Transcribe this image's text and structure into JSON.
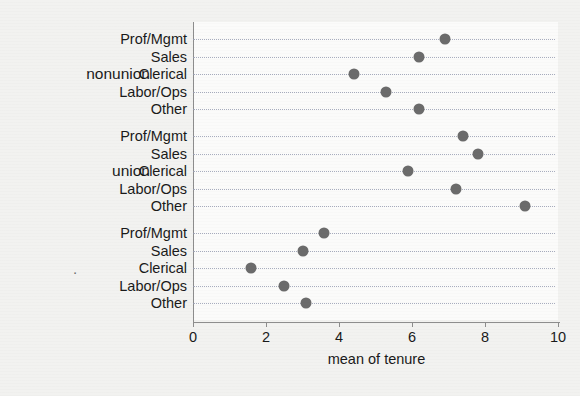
{
  "chart_data": {
    "type": "scatter",
    "subtype": "dot-plot",
    "title": "",
    "xlabel": "mean of tenure",
    "ylabel": "",
    "xlim": [
      0,
      10
    ],
    "xticks": [
      0,
      2,
      4,
      6,
      8,
      10
    ],
    "xtick_labels": [
      "0",
      "2",
      "4",
      "6",
      "8",
      "10"
    ],
    "grid": true,
    "grid_style": "horizontal dotted",
    "legend": "none",
    "marker_color": "#6b6b6b",
    "background_color": "#f2f2f0",
    "plot_background_color": "#fbfbfa",
    "axis_color": "#8d8d8d",
    "groups": [
      {
        "label": "nonunion",
        "categories": [
          "Prof/Mgmt",
          "Sales",
          "Clerical",
          "Labor/Ops",
          "Other"
        ],
        "values": [
          6.9,
          6.2,
          4.4,
          5.3,
          6.2
        ]
      },
      {
        "label": "union",
        "categories": [
          "Prof/Mgmt",
          "Sales",
          "Clerical",
          "Labor/Ops",
          "Other"
        ],
        "values": [
          7.4,
          7.8,
          5.9,
          7.2,
          9.1
        ]
      },
      {
        "label": ".",
        "categories": [
          "Prof/Mgmt",
          "Sales",
          "Clerical",
          "Labor/Ops",
          "Other"
        ],
        "values": [
          3.6,
          3.0,
          1.6,
          2.5,
          3.1
        ]
      }
    ]
  }
}
